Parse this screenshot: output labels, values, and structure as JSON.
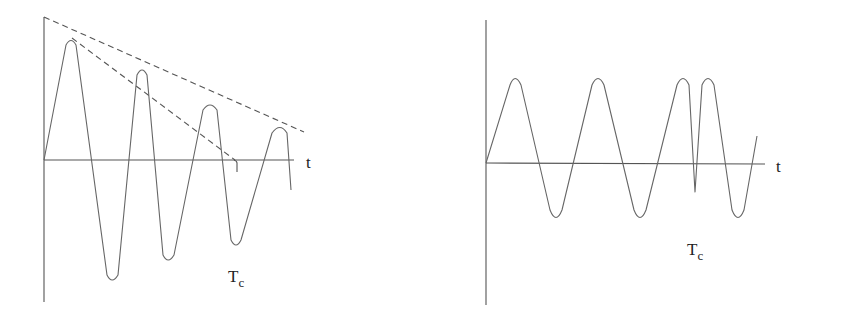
{
  "diagrams": [
    {
      "name": "damped-oscillation",
      "x_axis_label": "t",
      "marker_label": "T",
      "marker_subscript": "c",
      "description": "Oscillation with decaying amplitude; dashed envelope lines"
    },
    {
      "name": "constant-oscillation",
      "x_axis_label": "t",
      "marker_label": "T",
      "marker_subscript": "c",
      "description": "Oscillation with constant amplitude and a brief disruption at Tc"
    }
  ],
  "colors": {
    "line": "#666666",
    "axis": "#555555",
    "background": "#ffffff"
  }
}
